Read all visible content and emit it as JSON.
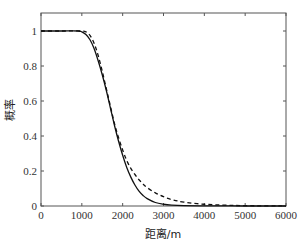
{
  "chart_data": {
    "type": "line",
    "title": "",
    "xlabel": "距离/m",
    "ylabel": "概率",
    "xlim": [
      0,
      6000
    ],
    "ylim": [
      0,
      1.1
    ],
    "grid": false,
    "legend": null,
    "x_ticks": [
      0,
      1000,
      2000,
      3000,
      4000,
      5000,
      6000
    ],
    "y_ticks": [
      0,
      0.2,
      0.4,
      0.6,
      0.8,
      1
    ],
    "y_tick_labels": [
      "0",
      "0.2",
      "0.4",
      "0.6",
      "0.8",
      "1"
    ],
    "series": [
      {
        "name": "solid",
        "style": "solid",
        "color": "#111111",
        "x": [
          0,
          500,
          900,
          1000,
          1100,
          1200,
          1300,
          1400,
          1500,
          1600,
          1700,
          1800,
          1900,
          2000,
          2100,
          2200,
          2300,
          2400,
          2500,
          2600,
          2800,
          3000,
          3200,
          3500,
          4000,
          5000,
          6000
        ],
        "y": [
          1,
          1,
          1,
          0.995,
          0.98,
          0.95,
          0.9,
          0.83,
          0.75,
          0.66,
          0.56,
          0.46,
          0.37,
          0.29,
          0.22,
          0.165,
          0.12,
          0.085,
          0.06,
          0.042,
          0.02,
          0.01,
          0.005,
          0.002,
          0.001,
          0,
          0
        ]
      },
      {
        "name": "dashed",
        "style": "dashed",
        "color": "#111111",
        "x": [
          0,
          500,
          1000,
          1100,
          1200,
          1300,
          1400,
          1500,
          1600,
          1700,
          1800,
          1900,
          2000,
          2100,
          2200,
          2300,
          2400,
          2500,
          2600,
          2800,
          3000,
          3200,
          3500,
          4000,
          4500,
          5000,
          6000
        ],
        "y": [
          1,
          1,
          1,
          0.995,
          0.975,
          0.93,
          0.86,
          0.77,
          0.67,
          0.57,
          0.47,
          0.39,
          0.32,
          0.26,
          0.215,
          0.18,
          0.15,
          0.125,
          0.105,
          0.075,
          0.053,
          0.037,
          0.022,
          0.01,
          0.005,
          0.002,
          0
        ]
      }
    ]
  }
}
